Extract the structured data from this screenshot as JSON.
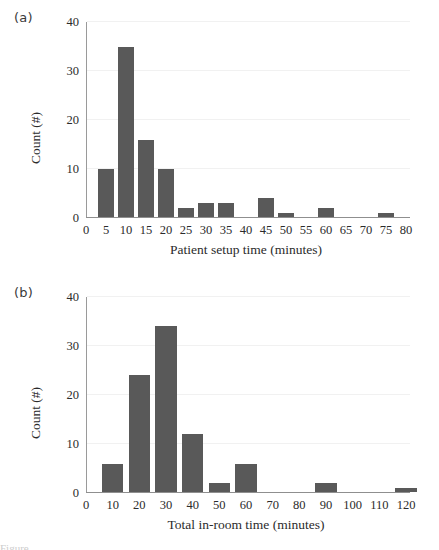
{
  "figure": {
    "background": "#ffffff",
    "bar_color": "#595959",
    "axis_color": "#949494",
    "gridline_color": "#f1f1f1",
    "caption_partial": "Figure"
  },
  "panels": [
    {
      "key": "a",
      "label": "(a)"
    },
    {
      "key": "b",
      "label": "(b)"
    }
  ],
  "chart_data": [
    {
      "type": "bar",
      "panel": "(a)",
      "title": "",
      "xlabel": "Patient setup time (minutes)",
      "ylabel": "Count (#)",
      "xlim": [
        0,
        80
      ],
      "ylim": [
        0,
        40
      ],
      "xticks": [
        0,
        5,
        10,
        15,
        20,
        25,
        30,
        35,
        40,
        45,
        50,
        55,
        60,
        65,
        70,
        75,
        80
      ],
      "xtick_labels": [
        "0",
        "5",
        "10",
        "15",
        "20",
        "25",
        "30",
        "35",
        "40",
        "45",
        "50",
        "55",
        "60",
        "65",
        "70",
        "75",
        "80"
      ],
      "yticks": [
        0,
        10,
        20,
        30,
        40
      ],
      "ytick_labels": [
        "0",
        "10",
        "20",
        "30",
        "40"
      ],
      "grid": true,
      "legend": "none",
      "bar_width_units": 4,
      "categories": [
        5,
        10,
        15,
        20,
        25,
        30,
        35,
        40,
        45,
        50,
        55,
        60,
        65,
        70,
        75,
        80
      ],
      "values": [
        10,
        35,
        16,
        10,
        2,
        3,
        3,
        0,
        4,
        1,
        0,
        2,
        0,
        0,
        1,
        0
      ]
    },
    {
      "type": "bar",
      "panel": "(b)",
      "title": "",
      "xlabel": "Total in-room time (minutes)",
      "ylabel": "Count (#)",
      "xlim": [
        0,
        120
      ],
      "ylim": [
        0,
        40
      ],
      "xticks": [
        0,
        10,
        20,
        30,
        40,
        50,
        60,
        70,
        80,
        90,
        100,
        110,
        120
      ],
      "xtick_labels": [
        "0",
        "10",
        "20",
        "30",
        "40",
        "50",
        "60",
        "70",
        "80",
        "90",
        "100",
        "110",
        "120"
      ],
      "yticks": [
        0,
        10,
        20,
        30,
        40
      ],
      "ytick_labels": [
        "0",
        "10",
        "20",
        "30",
        "40"
      ],
      "grid": true,
      "legend": "none",
      "bar_width_units": 8,
      "categories": [
        10,
        20,
        30,
        40,
        50,
        60,
        70,
        80,
        90,
        100,
        110,
        120
      ],
      "values": [
        6,
        24,
        34,
        12,
        2,
        6,
        0,
        0,
        2,
        0,
        0,
        1
      ]
    }
  ]
}
